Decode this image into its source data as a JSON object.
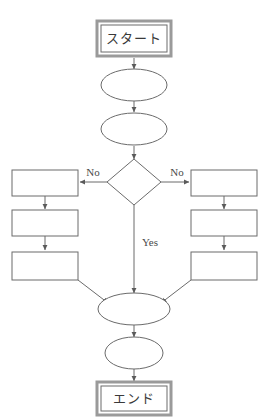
{
  "diagram": {
    "title": "",
    "background_color": "#ffffff",
    "stroke_color": "#6b6b6b",
    "terminator_frame_color": "#9a9a9a",
    "text_color": "#3a3a3a"
  },
  "nodes": {
    "start": {
      "label": "スタート",
      "shape": "terminator"
    },
    "process_top_1": {
      "label": "",
      "shape": "ellipse"
    },
    "process_top_2": {
      "label": "",
      "shape": "ellipse"
    },
    "decision": {
      "label": "",
      "shape": "diamond"
    },
    "left_1": {
      "label": "",
      "shape": "rectangle"
    },
    "left_2": {
      "label": "",
      "shape": "rectangle"
    },
    "left_3": {
      "label": "",
      "shape": "rectangle"
    },
    "right_1": {
      "label": "",
      "shape": "rectangle"
    },
    "right_2": {
      "label": "",
      "shape": "rectangle"
    },
    "right_3": {
      "label": "",
      "shape": "rectangle"
    },
    "merge": {
      "label": "",
      "shape": "ellipse"
    },
    "process_bottom": {
      "label": "",
      "shape": "ellipse"
    },
    "end": {
      "label": "エンド",
      "shape": "terminator"
    }
  },
  "edge_labels": {
    "no_left": "No",
    "no_right": "No",
    "yes_center": "Yes"
  }
}
